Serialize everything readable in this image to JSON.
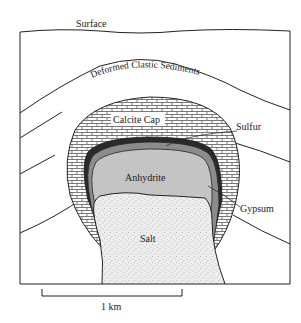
{
  "diagram": {
    "type": "geologic-cross-section",
    "labels": {
      "surface": "Surface",
      "sediments": "Deformed Clastic Sediments",
      "calcite_cap": "Calcite Cap",
      "sulfur": "Sulfur",
      "anhydrite": "Anhydrite",
      "gypsum": "Gypsum",
      "salt": "Salt"
    },
    "scale_bar": {
      "label": "1 km"
    },
    "colors": {
      "sulfur": "#2a2a2a",
      "gypsum": "#8c8c8c",
      "anhydrite": "#c4c4c4",
      "salt": "#ececec",
      "calcite": "#ffffff",
      "line": "#222222"
    }
  }
}
